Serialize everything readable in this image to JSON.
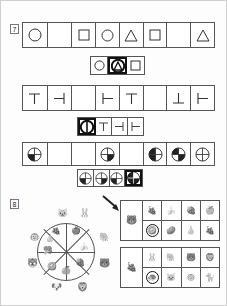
{
  "page": {
    "background": "#ffffff",
    "line_color": "#555555",
    "select_color": "#111111"
  },
  "sections": [
    {
      "number": "7",
      "type": "pattern-completion",
      "rows": [
        {
          "name": "shape-pattern-row",
          "prompt_cells": [
            {
              "shape": "circle"
            },
            {
              "shape": "blank"
            },
            {
              "shape": "square"
            },
            {
              "shape": "circle"
            },
            {
              "shape": "triangle"
            },
            {
              "shape": "square"
            },
            {
              "shape": "blank"
            },
            {
              "shape": "triangle"
            }
          ],
          "answer_cells": [
            {
              "shape": "circle",
              "selected": false
            },
            {
              "shape": "circle-triangle",
              "selected": true
            },
            {
              "shape": "square",
              "selected": false
            }
          ]
        },
        {
          "name": "tee-pattern-row",
          "prompt_cells": [
            {
              "shape": "tee-down"
            },
            {
              "shape": "tee-right"
            },
            {
              "shape": "blank"
            },
            {
              "shape": "tee-left"
            },
            {
              "shape": "tee-down"
            },
            {
              "shape": "blank"
            },
            {
              "shape": "tee-up"
            },
            {
              "shape": "tee-left"
            }
          ],
          "answer_cells": [
            {
              "shape": "circle-bar",
              "selected": true
            },
            {
              "shape": "tee-down",
              "selected": false
            },
            {
              "shape": "tee-right",
              "selected": false
            },
            {
              "shape": "tee-left",
              "selected": false
            }
          ]
        },
        {
          "name": "quadrant-pattern-row",
          "prompt_cells": [
            {
              "shape": "quad-bl"
            },
            {
              "shape": "blank"
            },
            {
              "shape": "blank"
            },
            {
              "shape": "quad-br"
            },
            {
              "shape": "blank"
            },
            {
              "shape": "quad-left"
            },
            {
              "shape": "quad-tl-br"
            },
            {
              "shape": "quad-empty"
            }
          ],
          "answer_cells": [
            {
              "shape": "quad-bl",
              "selected": false
            },
            {
              "shape": "quad-br",
              "selected": false
            },
            {
              "shape": "quad-bl2",
              "selected": false
            },
            {
              "shape": "quad-full",
              "selected": true
            }
          ]
        }
      ]
    },
    {
      "number": "8",
      "type": "spinner-matching",
      "wheel": {
        "name": "spinner-wheel",
        "segments": 8,
        "inner_items": [
          "🍇",
          "🍎",
          "🍌",
          "🍓",
          "🍊",
          "🥝",
          "🥦",
          "🍐"
        ],
        "outer_items": [
          "🐱",
          "🐰",
          "🐘",
          "🐻",
          "🦁",
          "🐶",
          "🐯",
          "🐵"
        ],
        "arrow": "spinner-arrow"
      },
      "grids": [
        {
          "name": "animal-to-fruit-grid",
          "header_item": "🐻",
          "header_kind": "animal",
          "rows": [
            {
              "cells": [
                {
                  "item": "🍇",
                  "selected": false
                },
                {
                  "item": "🍌",
                  "selected": false
                },
                {
                  "item": "🍓",
                  "selected": false
                },
                {
                  "item": "🍏",
                  "selected": false
                }
              ]
            },
            {
              "cells": [
                {
                  "item": "🥝",
                  "selected": true
                },
                {
                  "item": "🥔",
                  "selected": false
                },
                {
                  "item": "🍐",
                  "selected": false
                },
                {
                  "item": "🍇",
                  "selected": false
                }
              ]
            }
          ]
        },
        {
          "name": "fruit-to-animal-grid",
          "header_item": "🍇",
          "header_kind": "fruit",
          "rows": [
            {
              "cells": [
                {
                  "item": "🐰",
                  "selected": false
                },
                {
                  "item": "🐘",
                  "selected": false
                },
                {
                  "item": "🐻",
                  "selected": false
                },
                {
                  "item": "🦁",
                  "selected": false
                }
              ]
            },
            {
              "cells": [
                {
                  "item": "🐢",
                  "selected": true
                },
                {
                  "item": "🐱",
                  "selected": false
                },
                {
                  "item": "🐵",
                  "selected": false
                },
                {
                  "item": "🐈",
                  "selected": false
                }
              ]
            }
          ]
        }
      ]
    }
  ]
}
